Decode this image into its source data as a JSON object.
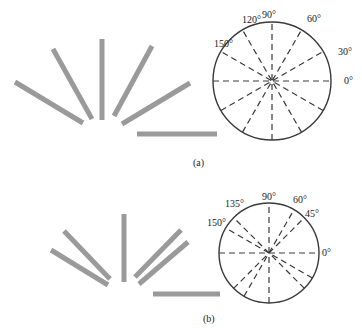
{
  "panels": [
    {
      "id": "a",
      "caption": "(a)",
      "stick_angles_deg": [
        150,
        120,
        90,
        60,
        30,
        0
      ],
      "rose_diagram": {
        "dashed_line_angles_deg": [
          0,
          30,
          60,
          90,
          120,
          150
        ],
        "labels": {
          "label_0": "0°",
          "label_30": "30°",
          "label_60": "60°",
          "label_90": "90°",
          "label_120": "120°",
          "label_150": "150°"
        }
      }
    },
    {
      "id": "b",
      "caption": "(b)",
      "stick_angles_deg": [
        150,
        135,
        90,
        60,
        45,
        0
      ],
      "rose_diagram": {
        "dashed_line_angles_deg": [
          0,
          45,
          60,
          90,
          135,
          150
        ],
        "labels": {
          "label_0": "0°",
          "label_45": "45°",
          "label_60": "60°",
          "label_90": "90°",
          "label_135": "135°",
          "label_150": "150°"
        }
      }
    }
  ],
  "colors": {
    "stick": "#9a9a9a",
    "line": "#3a3a3a",
    "background": "#ffffff"
  }
}
